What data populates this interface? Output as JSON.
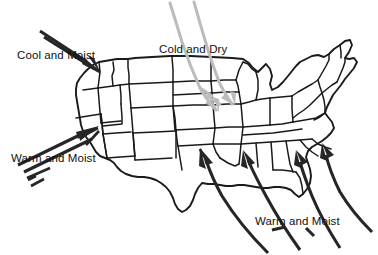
{
  "diagram": {
    "background_color": "#ffffff",
    "map_line_color": "#1a1a1a",
    "dark_arrow_color": "#262626",
    "gray_arrow_color": "#bcbcbc"
  },
  "labels": {
    "cool_and_moist": "Cool and Moist",
    "cold_and_dry": "Cold and Dry",
    "warm_and_moist_west": "Warm and Moist",
    "warm_and_moist_southeast": "Warm and Moist"
  },
  "air_masses": [
    {
      "name": "cool-and-moist",
      "label": "Cool and Moist",
      "color": "#262626",
      "origin": "Northern Pacific Ocean",
      "direction": "toward the southeast into the Pacific Northwest",
      "stroke_count": 2
    },
    {
      "name": "cold-and-dry",
      "label": "Cold and Dry",
      "color": "#bcbcbc",
      "origin": "Northern Canada",
      "direction": "toward the south-southeast into the Northern Plains",
      "stroke_count": 2
    },
    {
      "name": "warm-and-moist-west",
      "label": "Warm and Moist",
      "color": "#262626",
      "origin": "Subtropical Pacific Ocean",
      "direction": "toward the northeast into California and the Southwest",
      "stroke_count": 3
    },
    {
      "name": "warm-and-moist-southeast",
      "label": "Warm and Moist",
      "color": "#262626",
      "origin": "Gulf of Mexico and subtropical Atlantic Ocean",
      "direction": "toward the northwest into the Southeast and Mississippi Valley",
      "stroke_count": 4
    }
  ],
  "map": {
    "region": "Contiguous United States",
    "features": "state boundary outlines"
  }
}
